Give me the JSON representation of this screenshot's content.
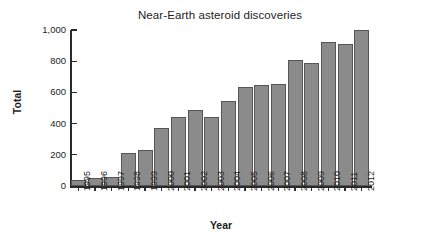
{
  "chart_data": {
    "type": "bar",
    "title": "Near-Earth asteroid discoveries",
    "xlabel": "Year",
    "ylabel": "Total",
    "categories": [
      "1995",
      "1996",
      "1997",
      "1998",
      "1999",
      "2000",
      "2001",
      "2002",
      "2003",
      "2004",
      "2005",
      "2006",
      "2007",
      "2008",
      "2009",
      "2010",
      "2011",
      "2012"
    ],
    "values": [
      40,
      50,
      55,
      210,
      230,
      370,
      445,
      490,
      440,
      545,
      635,
      645,
      655,
      805,
      790,
      925,
      910,
      1000
    ],
    "ylim": [
      0,
      1000
    ],
    "yticks": [
      0,
      200,
      400,
      600,
      800,
      1000
    ],
    "ytick_labels": [
      "0",
      "200",
      "400",
      "600",
      "800",
      "1,000"
    ],
    "grid": false,
    "legend": null,
    "bar_color": "#8b8b8b",
    "bar_edge_color": "#565656",
    "axis_color": "#2b2b2b",
    "text_color": "#1d1d1d"
  }
}
